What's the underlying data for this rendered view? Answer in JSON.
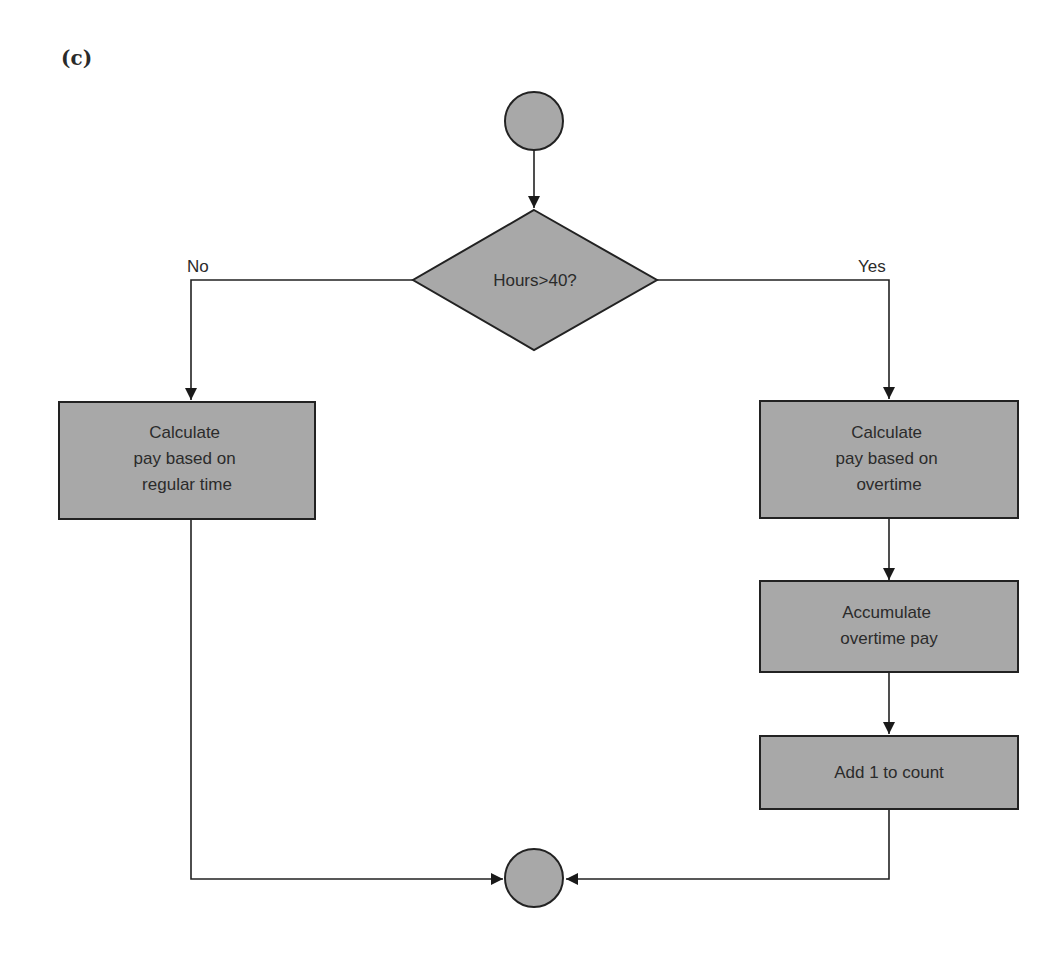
{
  "figure": {
    "label": "(c)"
  },
  "colors": {
    "shape_fill": "#a8a8a8",
    "stroke": "#222222",
    "background": "#ffffff"
  },
  "nodes": {
    "start": {
      "type": "connector-circle",
      "label": ""
    },
    "decision": {
      "type": "diamond",
      "label": "Hours>40?"
    },
    "regular": {
      "type": "process",
      "lines": [
        "Calculate",
        "pay based on",
        "regular time"
      ]
    },
    "overtime": {
      "type": "process",
      "lines": [
        "Calculate",
        "pay based on",
        "overtime"
      ]
    },
    "accumulate": {
      "type": "process",
      "lines": [
        "Accumulate",
        "overtime pay"
      ]
    },
    "count": {
      "type": "process",
      "lines": [
        "Add 1 to count"
      ]
    },
    "end": {
      "type": "connector-circle",
      "label": ""
    }
  },
  "edges": {
    "no_label": "No",
    "yes_label": "Yes"
  }
}
